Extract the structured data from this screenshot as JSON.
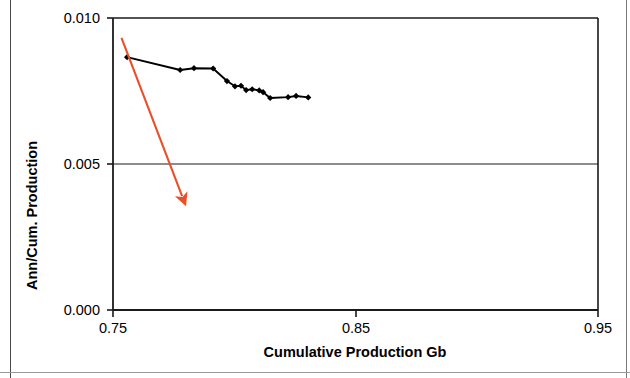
{
  "chart_data": {
    "type": "line",
    "title": "",
    "xlabel": "Cumulative Production Gb",
    "ylabel": "Ann/Cum. Production",
    "xlim": [
      0.75,
      0.95
    ],
    "ylim": [
      0.0,
      0.01
    ],
    "xticks": [
      0.75,
      0.85,
      0.95
    ],
    "xtick_labels": [
      "0.75",
      "0.85",
      "0.95"
    ],
    "yticks": [
      0.0,
      0.005,
      0.01
    ],
    "ytick_labels": [
      "0.000",
      "0.005",
      "0.010"
    ],
    "grid": "horizontal-only",
    "legend": "none",
    "series": [
      {
        "name": "Ann/Cum. Production",
        "color": "#000000",
        "marker": "diamond",
        "x": [
          0.7558,
          0.7777,
          0.7834,
          0.7913,
          0.797,
          0.8003,
          0.8028,
          0.8049,
          0.8074,
          0.8103,
          0.8119,
          0.8148,
          0.8222,
          0.8255,
          0.8305
        ],
        "y": [
          0.00866,
          0.00822,
          0.00828,
          0.00827,
          0.00784,
          0.00766,
          0.00768,
          0.00753,
          0.00756,
          0.00752,
          0.00746,
          0.00726,
          0.00729,
          0.00733,
          0.00728
        ]
      }
    ],
    "trendline": {
      "name": "decline-trend-arrow",
      "color": "#E8502A",
      "x_start": 0.7535,
      "y_start": 0.00932,
      "x_end": 0.7785,
      "y_end": 0.0039,
      "arrow_at_end": true
    }
  },
  "axes": {
    "y_label": "Ann/Cum. Production",
    "x_label": "Cumulative Production Gb",
    "y_ticks": [
      "0.010",
      "0.005",
      "0.000"
    ],
    "x_ticks": [
      "0.75",
      "0.85",
      "0.95"
    ]
  },
  "colors": {
    "axis": "#1a1a1a",
    "series": "#000000",
    "trend": "#E8502A",
    "background": "#ffffff"
  }
}
